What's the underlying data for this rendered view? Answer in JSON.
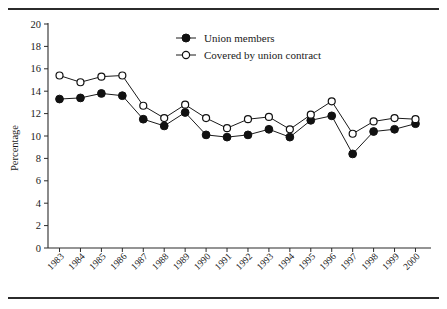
{
  "chart_data": {
    "type": "line",
    "title": "",
    "subtitle": "",
    "xlabel": "",
    "ylabel": "Percentage",
    "categories": [
      "1983",
      "1984",
      "1985",
      "1986",
      "1987",
      "1988",
      "1989",
      "1990",
      "1991",
      "1992",
      "1993",
      "1994",
      "1995",
      "1996",
      "1997",
      "1998",
      "1999",
      "2000"
    ],
    "x": [
      1983,
      1984,
      1985,
      1986,
      1987,
      1988,
      1989,
      1990,
      1991,
      1992,
      1993,
      1994,
      1995,
      1996,
      1997,
      1998,
      1999,
      2000
    ],
    "series": [
      {
        "name": "Union members",
        "marker": "filled-circle",
        "values": [
          13.3,
          13.4,
          13.8,
          13.6,
          11.5,
          10.9,
          12.1,
          10.1,
          9.9,
          10.1,
          10.6,
          9.9,
          11.4,
          11.8,
          8.4,
          10.4,
          10.6,
          11.1
        ]
      },
      {
        "name": "Covered by union contract",
        "marker": "open-circle",
        "values": [
          15.4,
          14.8,
          15.3,
          15.4,
          12.7,
          11.6,
          12.8,
          11.6,
          10.7,
          11.5,
          11.7,
          10.6,
          11.9,
          13.1,
          10.2,
          11.3,
          11.6,
          11.5
        ]
      }
    ],
    "ylim": [
      0,
      20
    ],
    "ytick_values": [
      0,
      2,
      4,
      6,
      8,
      10,
      12,
      14,
      16,
      18,
      20
    ],
    "ytick_labels": [
      "0",
      "2",
      "4",
      "6",
      "8",
      "10",
      "12",
      "14",
      "16",
      "18",
      "20"
    ],
    "grid": false,
    "legend_position": "top-center",
    "legend_entries": [
      "Union members",
      "Covered by union contract"
    ],
    "annotations": []
  },
  "figure": {
    "has_top_rule": true,
    "has_bottom_rule": true,
    "rule_color": "#2b2b2b",
    "background_color": "#ffffff",
    "axis_color": "#2b2b2b",
    "series_color": "#111111"
  }
}
